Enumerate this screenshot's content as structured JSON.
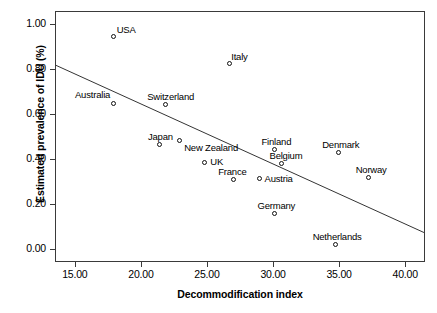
{
  "chart_data": {
    "type": "scatter",
    "title": "",
    "xlabel": "Decommodification index",
    "ylabel": "Estimated prevalence of IDU (%)",
    "xlim": [
      13.5,
      41.5
    ],
    "ylim": [
      -0.06,
      1.06
    ],
    "xticks": [
      "15.00",
      "20.00",
      "25.00",
      "30.00",
      "35.00",
      "40.00"
    ],
    "xtick_values": [
      15,
      20,
      25,
      30,
      35,
      40
    ],
    "yticks": [
      "0.00",
      "0.20",
      "0.40",
      "0.60",
      "0.80",
      "1.00"
    ],
    "ytick_values": [
      0.0,
      0.2,
      0.4,
      0.6,
      0.8,
      1.0
    ],
    "grid": false,
    "legend": "none",
    "points": [
      {
        "label": "USA",
        "x": 17.9,
        "y": 0.95,
        "label_pos": "above",
        "dx": 12,
        "dy": -2
      },
      {
        "label": "Italy",
        "x": 26.7,
        "y": 0.83,
        "label_pos": "above",
        "dx": 9,
        "dy": -2
      },
      {
        "label": "Australia",
        "x": 17.9,
        "y": 0.65,
        "label_pos": "left",
        "dx": -4,
        "dy": -9
      },
      {
        "label": "Switzerland",
        "x": 21.8,
        "y": 0.645,
        "label_pos": "above",
        "dx": 5,
        "dy": -3
      },
      {
        "label": "Japan",
        "x": 21.4,
        "y": 0.465,
        "label_pos": "above",
        "dx": 0,
        "dy": -3
      },
      {
        "label": "New Zealand",
        "x": 22.9,
        "y": 0.485,
        "label_pos": "right",
        "dx": 4,
        "dy": 7
      },
      {
        "label": "UK",
        "x": 24.8,
        "y": 0.385,
        "label_pos": "right",
        "dx": 5,
        "dy": -1
      },
      {
        "label": "France",
        "x": 27.0,
        "y": 0.31,
        "label_pos": "above",
        "dx": -2,
        "dy": -3
      },
      {
        "label": "Austria",
        "x": 28.9,
        "y": 0.315,
        "label_pos": "right",
        "dx": 5,
        "dy": 0
      },
      {
        "label": "Finland",
        "x": 30.1,
        "y": 0.445,
        "label_pos": "above",
        "dx": 1,
        "dy": -3
      },
      {
        "label": "Belgium",
        "x": 30.6,
        "y": 0.38,
        "label_pos": "above",
        "dx": 4,
        "dy": -3
      },
      {
        "label": "Germany",
        "x": 30.1,
        "y": 0.16,
        "label_pos": "above",
        "dx": 1,
        "dy": -3
      },
      {
        "label": "Denmark",
        "x": 34.9,
        "y": 0.43,
        "label_pos": "above",
        "dx": 2,
        "dy": -3
      },
      {
        "label": "Norway",
        "x": 37.2,
        "y": 0.32,
        "label_pos": "above",
        "dx": 2,
        "dy": -3
      },
      {
        "label": "Netherlands",
        "x": 34.7,
        "y": 0.02,
        "label_pos": "above",
        "dx": 1,
        "dy": -3
      }
    ],
    "trendline": {
      "type": "linear-fit",
      "x_start": 13.5,
      "y_start": 0.82,
      "x_end": 41.5,
      "y_end": 0.068,
      "color": "#333333"
    },
    "marker_style": {
      "shape": "open-circle",
      "color": "#111111",
      "size_px": 5
    }
  },
  "figure": {
    "caption_partial": ""
  }
}
